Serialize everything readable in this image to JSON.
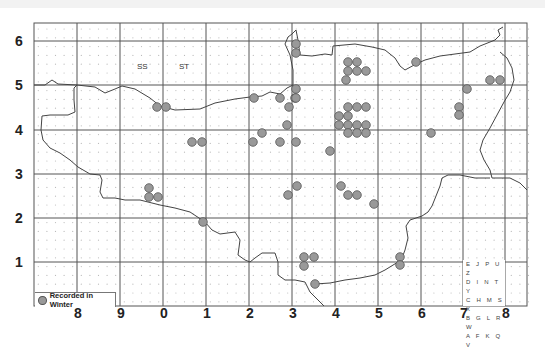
{
  "map": {
    "grid_squares": [
      "SS",
      "ST"
    ],
    "y_axis_labels": [
      {
        "label": "6",
        "y": 41
      },
      {
        "label": "5",
        "y": 85
      },
      {
        "label": "4",
        "y": 130
      },
      {
        "label": "3",
        "y": 174
      },
      {
        "label": "2",
        "y": 218
      },
      {
        "label": "1",
        "y": 262
      }
    ],
    "x_axis_labels": [
      {
        "label": "8",
        "x": 77
      },
      {
        "label": "9",
        "x": 120
      },
      {
        "label": "0",
        "x": 163
      },
      {
        "label": "1",
        "x": 206
      },
      {
        "label": "2",
        "x": 249
      },
      {
        "label": "3",
        "x": 292
      },
      {
        "label": "4",
        "x": 335
      },
      {
        "label": "5",
        "x": 378
      },
      {
        "label": "6",
        "x": 421
      },
      {
        "label": "7",
        "x": 463
      },
      {
        "label": "8",
        "x": 505
      }
    ],
    "legend": {
      "label": "Recorded in Winter",
      "dot_color": "#999999"
    },
    "tetrad_key": [
      "E J P U Z",
      "D I N T Y",
      "C H M S X",
      "B G L R W",
      "A F K Q V"
    ],
    "colors": {
      "dot_fill": "#999999",
      "dot_stroke": "#555555",
      "grid": "#555555",
      "boundary": "#444444"
    }
  }
}
